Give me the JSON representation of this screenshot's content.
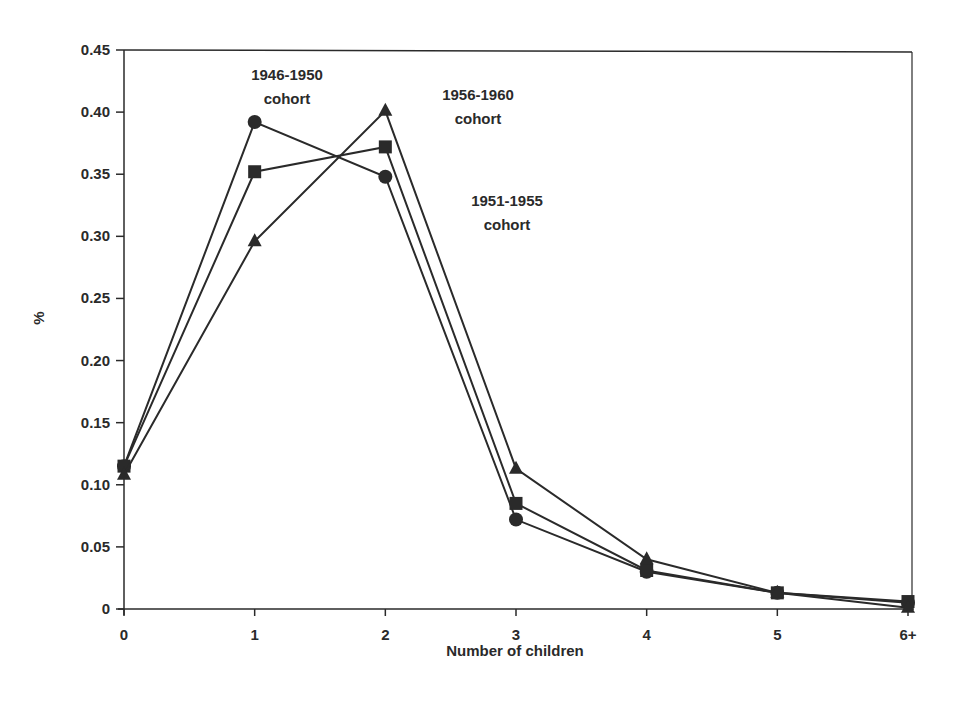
{
  "chart_data": {
    "type": "line",
    "title": "",
    "xlabel": "Number of children",
    "ylabel": "%",
    "categories": [
      "0",
      "1",
      "2",
      "3",
      "4",
      "5",
      "6+"
    ],
    "ylim": [
      0,
      0.45
    ],
    "yticks": [
      "0",
      "0.05",
      "0.10",
      "0.15",
      "0.20",
      "0.25",
      "0.30",
      "0.35",
      "0.40",
      "0.45"
    ],
    "grid": false,
    "legend": "none (inline annotations)",
    "series": [
      {
        "name": "1946-1950 cohort",
        "marker": "circle",
        "values": [
          0.115,
          0.392,
          0.348,
          0.072,
          0.03,
          0.013,
          0.005
        ]
      },
      {
        "name": "1951-1955 cohort",
        "marker": "square",
        "values": [
          0.115,
          0.352,
          0.372,
          0.085,
          0.031,
          0.013,
          0.006
        ]
      },
      {
        "name": "1956-1960 cohort",
        "marker": "triangle",
        "values": [
          0.108,
          0.296,
          0.401,
          0.113,
          0.04,
          0.013,
          0.001
        ]
      }
    ],
    "annotations": [
      {
        "line1": "1946-1950",
        "line2": "cohort",
        "x": 287,
        "y": 80
      },
      {
        "line1": "1956-1960",
        "line2": "cohort",
        "x": 478,
        "y": 100
      },
      {
        "line1": "1951-1955",
        "line2": "cohort",
        "x": 507,
        "y": 206
      }
    ]
  },
  "colors": {
    "ink": "#2a2a2a",
    "background": "#ffffff"
  }
}
